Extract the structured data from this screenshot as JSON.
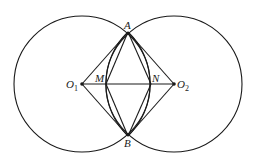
{
  "diagram": {
    "points": {
      "A": {
        "label": "A",
        "x": 128,
        "y": 32
      },
      "B": {
        "label": "B",
        "x": 128,
        "y": 136
      },
      "O1": {
        "label": "O",
        "sub": "1",
        "x": 82,
        "y": 84
      },
      "O2": {
        "label": "O",
        "sub": "2",
        "x": 174,
        "y": 84
      },
      "M": {
        "label": "M",
        "x": 106,
        "y": 84
      },
      "N": {
        "label": "N",
        "x": 151,
        "y": 84
      }
    },
    "circles": [
      {
        "name": "circle-O1",
        "cx": 82,
        "cy": 84,
        "r": 68
      },
      {
        "name": "circle-O2",
        "cx": 174,
        "cy": 84,
        "r": 68
      }
    ],
    "segments": [
      "O1-A",
      "O1-B",
      "O2-A",
      "O2-B",
      "A-M",
      "M-B",
      "A-N",
      "N-B",
      "O1-O2"
    ],
    "arcs": [
      "A-M-B",
      "A-N-B"
    ],
    "stroke_color": "#1a1a1a"
  }
}
